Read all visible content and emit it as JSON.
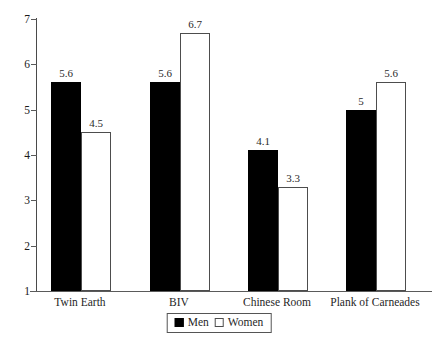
{
  "chart_data": {
    "type": "bar",
    "title": "",
    "subtitle": "",
    "xlabel": "",
    "ylabel": "",
    "ylim": [
      1,
      7
    ],
    "yticks": [
      "7",
      "6",
      "5",
      "4",
      "3",
      "2",
      "1"
    ],
    "grid": false,
    "legend_position": "bottom-center",
    "categories": [
      "Twin Earth",
      "BIV",
      "Chinese Room",
      "Plank of Carneades"
    ],
    "series": [
      {
        "name": "Men",
        "color": "#000000",
        "style": "filled",
        "values": [
          5.6,
          5.6,
          4.1,
          5
        ],
        "labels": [
          "5.6",
          "5.6",
          "4.1",
          "5"
        ]
      },
      {
        "name": "Women",
        "color": "#ffffff",
        "style": "outlined",
        "values": [
          4.5,
          6.7,
          3.3,
          5.6
        ],
        "labels": [
          "4.5",
          "6.7",
          "3.3",
          "5.6"
        ]
      }
    ]
  },
  "legend": {
    "items": [
      {
        "label": "Men",
        "swatch": "filled-black-square"
      },
      {
        "label": "Women",
        "swatch": "outlined-white-square"
      }
    ]
  },
  "colors": {
    "men_fill": "#000000",
    "women_fill": "#ffffff",
    "women_stroke": "#4d4d4d",
    "axis": "#5a5a5a",
    "text": "#1f1f1f",
    "background": "#ffffff"
  }
}
